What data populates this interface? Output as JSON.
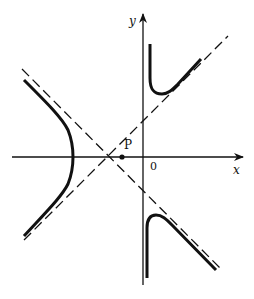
{
  "diagram": {
    "type": "hyperbola-with-asymptotes",
    "axes": {
      "x_label": "x",
      "y_label": "y",
      "origin_label": "0"
    },
    "point": {
      "label": "P"
    },
    "colors": {
      "ink": "#111111",
      "background": "#ffffff"
    }
  }
}
